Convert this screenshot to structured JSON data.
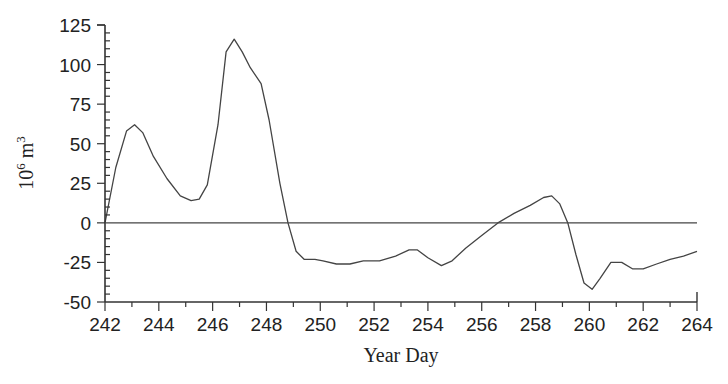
{
  "chart_data": {
    "type": "line",
    "title": "",
    "xlabel": "Year Day",
    "ylabel": "10^6 m^3",
    "ylabel_base": "10",
    "ylabel_exp": "6",
    "ylabel_unit": "m",
    "ylabel_unit_exp": "3",
    "xlim": [
      242,
      264
    ],
    "ylim": [
      -50,
      125
    ],
    "xticks": [
      242,
      244,
      246,
      248,
      250,
      252,
      254,
      256,
      258,
      260,
      262,
      264
    ],
    "yticks": [
      125,
      100,
      75,
      50,
      25,
      0,
      -25,
      -50
    ],
    "reference_line": 0,
    "grid": false,
    "legend": null,
    "series": [
      {
        "name": "volume transport",
        "x": [
          242.0,
          242.4,
          242.8,
          243.1,
          243.4,
          243.8,
          244.3,
          244.8,
          245.2,
          245.5,
          245.8,
          246.2,
          246.5,
          246.8,
          247.1,
          247.4,
          247.8,
          248.1,
          248.5,
          248.8,
          249.1,
          249.4,
          249.8,
          250.1,
          250.6,
          251.1,
          251.6,
          252.2,
          252.8,
          253.3,
          253.6,
          254.0,
          254.5,
          254.9,
          255.4,
          256.0,
          256.6,
          257.2,
          257.8,
          258.3,
          258.6,
          258.9,
          259.2,
          259.5,
          259.8,
          260.1,
          260.4,
          260.8,
          261.2,
          261.6,
          262.0,
          262.5,
          263.0,
          263.5,
          264.0
        ],
        "values": [
          0,
          35,
          58,
          62,
          57,
          42,
          28,
          17,
          14,
          15,
          24,
          62,
          108,
          116,
          108,
          98,
          88,
          65,
          25,
          0,
          -18,
          -23,
          -23,
          -24,
          -26,
          -26,
          -24,
          -24,
          -21,
          -17,
          -17,
          -22,
          -27,
          -24,
          -16,
          -8,
          0,
          6,
          11,
          16,
          17,
          12,
          0,
          -20,
          -38,
          -42,
          -35,
          -25,
          -25,
          -29,
          -29,
          -26,
          -23,
          -21,
          -18
        ]
      }
    ]
  }
}
